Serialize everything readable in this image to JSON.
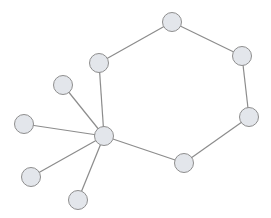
{
  "graph": {
    "colors": {
      "node_fill": "#e3e6eb",
      "node_stroke": "#8e8e8e",
      "edge": "#8c8c8c",
      "background": "#ffffff"
    },
    "node_radius": 9.5,
    "nodes": [
      {
        "id": "A",
        "x": 172,
        "y": 22
      },
      {
        "id": "B",
        "x": 242,
        "y": 56
      },
      {
        "id": "C",
        "x": 99,
        "y": 63
      },
      {
        "id": "D",
        "x": 249,
        "y": 117
      },
      {
        "id": "E",
        "x": 63,
        "y": 85
      },
      {
        "id": "F",
        "x": 24,
        "y": 124
      },
      {
        "id": "G",
        "x": 104,
        "y": 136
      },
      {
        "id": "H",
        "x": 184,
        "y": 163
      },
      {
        "id": "I",
        "x": 31,
        "y": 177
      },
      {
        "id": "J",
        "x": 78,
        "y": 200
      }
    ],
    "edges": [
      [
        "C",
        "A"
      ],
      [
        "A",
        "B"
      ],
      [
        "B",
        "D"
      ],
      [
        "D",
        "H"
      ],
      [
        "H",
        "G"
      ],
      [
        "G",
        "C"
      ],
      [
        "G",
        "E"
      ],
      [
        "G",
        "F"
      ],
      [
        "G",
        "I"
      ],
      [
        "G",
        "J"
      ]
    ]
  }
}
